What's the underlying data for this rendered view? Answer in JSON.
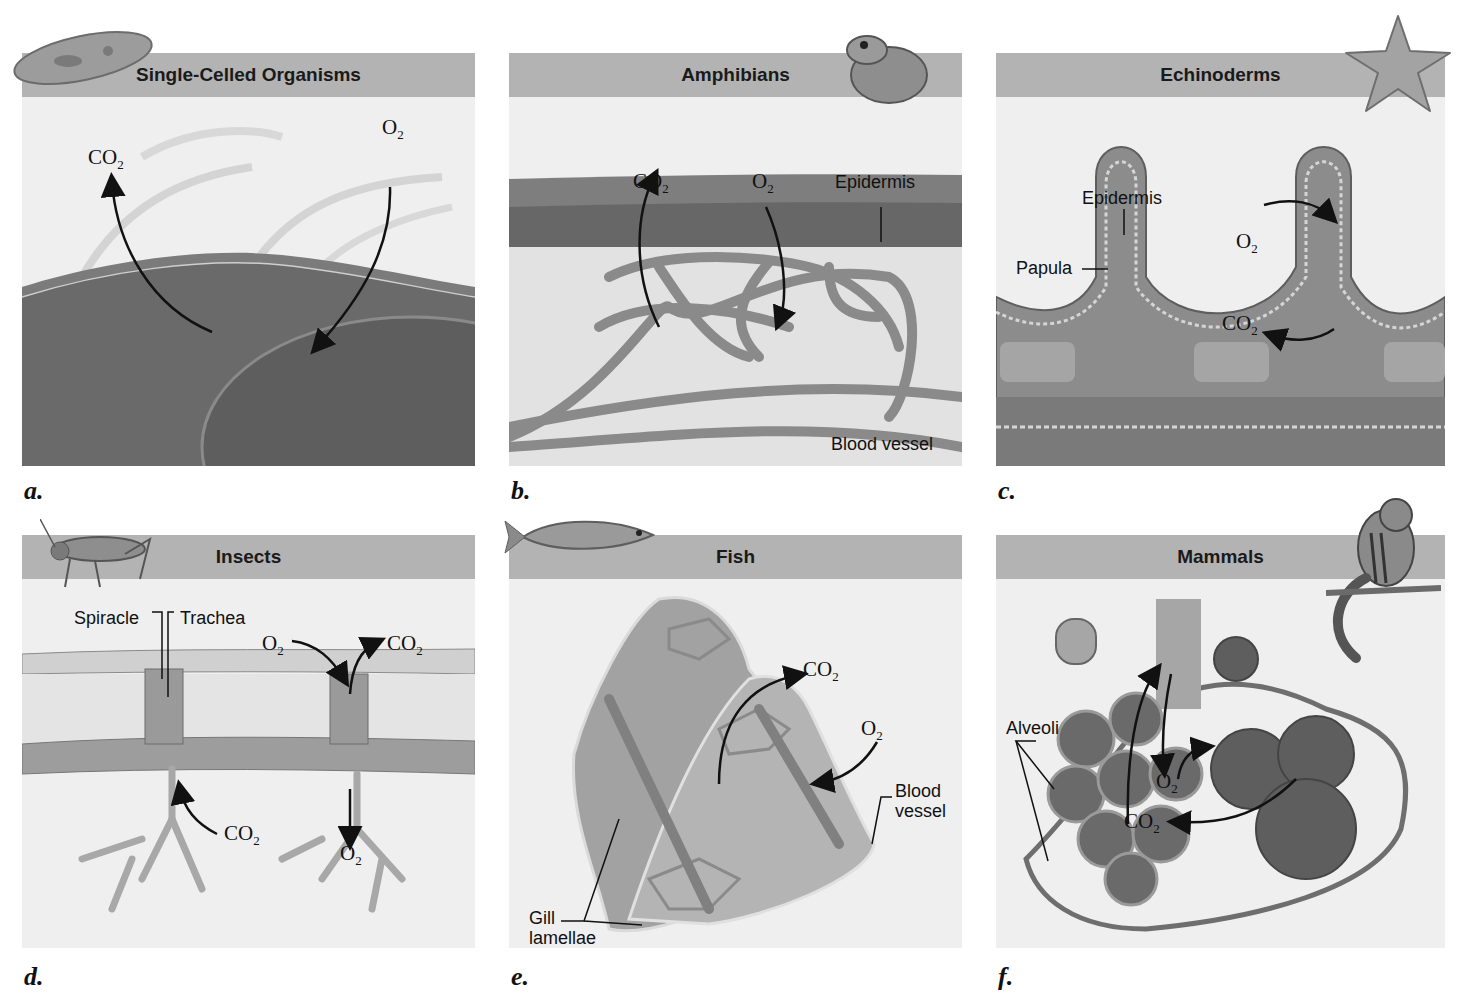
{
  "figure": {
    "panels": [
      {
        "letter": "a.",
        "title": "Single-Celled Organisms",
        "icon": "paramecium-icon",
        "labels": [],
        "gases": [
          {
            "formula": "CO",
            "subscript": "2",
            "direction": "out"
          },
          {
            "formula": "O",
            "subscript": "2",
            "direction": "in"
          }
        ]
      },
      {
        "letter": "b.",
        "title": "Amphibians",
        "icon": "frog-icon",
        "labels": [
          "Epidermis",
          "Blood vessel"
        ],
        "gases": [
          {
            "formula": "CO",
            "subscript": "2",
            "direction": "out"
          },
          {
            "formula": "O",
            "subscript": "2",
            "direction": "in"
          }
        ]
      },
      {
        "letter": "c.",
        "title": "Echinoderms",
        "icon": "starfish-icon",
        "labels": [
          "Epidermis",
          "Papula"
        ],
        "gases": [
          {
            "formula": "O",
            "subscript": "2",
            "direction": "in"
          },
          {
            "formula": "CO",
            "subscript": "2",
            "direction": "out"
          }
        ]
      },
      {
        "letter": "d.",
        "title": "Insects",
        "icon": "grasshopper-icon",
        "labels": [
          "Spiracle",
          "Trachea"
        ],
        "gases": [
          {
            "formula": "O",
            "subscript": "2",
            "direction": "in"
          },
          {
            "formula": "CO",
            "subscript": "2",
            "direction": "out"
          },
          {
            "formula": "CO",
            "subscript": "2",
            "direction": "out"
          },
          {
            "formula": "O",
            "subscript": "2",
            "direction": "in"
          }
        ]
      },
      {
        "letter": "e.",
        "title": "Fish",
        "icon": "fish-icon",
        "labels": [
          "Blood vessel",
          "Gill lamellae"
        ],
        "labels_split": {
          "blood": [
            "Blood",
            "vessel"
          ],
          "gill": [
            "Gill",
            "lamellae"
          ]
        },
        "gases": [
          {
            "formula": "CO",
            "subscript": "2",
            "direction": "out"
          },
          {
            "formula": "O",
            "subscript": "2",
            "direction": "in"
          }
        ]
      },
      {
        "letter": "f.",
        "title": "Mammals",
        "icon": "chipmunk-icon",
        "labels": [
          "Alveoli"
        ],
        "gases": [
          {
            "formula": "O",
            "subscript": "2",
            "direction": "in"
          },
          {
            "formula": "CO",
            "subscript": "2",
            "direction": "out"
          }
        ]
      }
    ],
    "colors": {
      "header": "#b3b3b3",
      "background": "#efefef",
      "tissue_dark": "#6f6f6f",
      "tissue_mid": "#9a9a9a",
      "vessel": "#8a8a8a",
      "arrow": "#111111"
    }
  }
}
